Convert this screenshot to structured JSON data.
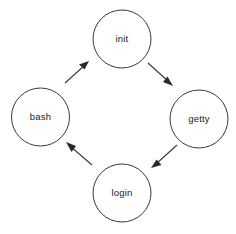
{
  "diagram": {
    "type": "state-cycle",
    "title": "",
    "background_color": "#ffffff",
    "stroke_color": "#3a3a3a",
    "text_color": "#1a1a1a",
    "nodes": [
      {
        "id": "init",
        "label": "init",
        "cx": 122,
        "cy": 39,
        "r": 29
      },
      {
        "id": "getty",
        "label": "getty",
        "cx": 199,
        "cy": 119,
        "r": 29
      },
      {
        "id": "login",
        "label": "login",
        "cx": 122,
        "cy": 193,
        "r": 29
      },
      {
        "id": "bash",
        "label": "bash",
        "cx": 40.5,
        "cy": 117,
        "r": 29
      }
    ],
    "edges": [
      {
        "id": "bash-to-init",
        "from": "bash",
        "to": "init",
        "label": "",
        "direction": "up-right"
      },
      {
        "id": "init-to-getty",
        "from": "init",
        "to": "getty",
        "label": "",
        "direction": "down-right"
      },
      {
        "id": "getty-to-login",
        "from": "getty",
        "to": "login",
        "label": "",
        "direction": "down-left"
      },
      {
        "id": "login-to-bash",
        "from": "login",
        "to": "bash",
        "label": "",
        "direction": "up-left"
      }
    ]
  }
}
